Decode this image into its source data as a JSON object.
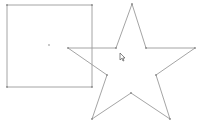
{
  "canvas": {
    "width": 198,
    "height": 127,
    "background": "#ffffff"
  },
  "stroke_color": "#9a9a9a",
  "shapes": {
    "square": {
      "kind": "rectangle",
      "points": [
        [
          7,
          5
        ],
        [
          92,
          5
        ],
        [
          92,
          87
        ],
        [
          7,
          87
        ]
      ],
      "center": [
        49,
        45
      ]
    },
    "star": {
      "kind": "five-point-star",
      "points": [
        [
          132,
          4
        ],
        [
          146,
          48
        ],
        [
          195,
          48
        ],
        [
          156,
          75
        ],
        [
          170,
          119
        ],
        [
          131,
          93
        ],
        [
          92,
          119
        ],
        [
          107,
          75
        ],
        [
          68,
          48
        ],
        [
          116,
          48
        ]
      ]
    }
  },
  "cursor": {
    "icon": "arrow-pointer-icon",
    "x": 120,
    "y": 53
  }
}
